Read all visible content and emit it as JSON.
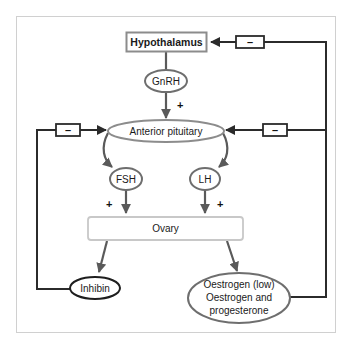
{
  "diagram": {
    "title": "",
    "nodes": {
      "hypothalamus": {
        "label": "Hypothalamus",
        "shape": "rect",
        "border_color": "#8c8c8c"
      },
      "gnrh": {
        "label": "GnRH",
        "shape": "ellipse",
        "border_color": "#6e6e6e"
      },
      "anterior_pituitary": {
        "label": "Anterior pituitary",
        "shape": "ellipse",
        "border_color": "#8c8c8c"
      },
      "fsh": {
        "label": "FSH",
        "shape": "ellipse",
        "border_color": "#6e6e6e"
      },
      "lh": {
        "label": "LH",
        "shape": "ellipse",
        "border_color": "#6e6e6e"
      },
      "ovary": {
        "label": "Ovary",
        "shape": "rounded-rect",
        "border_color": "#c8c8c8"
      },
      "inhibin": {
        "label": "Inhibin",
        "shape": "ellipse",
        "border_color": "#1e1e1e"
      },
      "oestrogen": {
        "label_line1": "Oestrogen (low)",
        "label_line2": "Oestrogen and",
        "label_line3": "progesterone",
        "shape": "ellipse",
        "border_color": "#6e6e6e"
      }
    },
    "signs": {
      "gnrh_to_pituitary": "+",
      "fsh_to_ovary": "+",
      "lh_to_ovary": "+",
      "inhibitor_top": "–",
      "inhibitor_middle_right": "–",
      "inhibitor_left": "–"
    },
    "edges": [
      {
        "from": "hypothalamus",
        "to": "gnrh",
        "type": "line"
      },
      {
        "from": "gnrh",
        "to": "anterior_pituitary",
        "type": "stimulate",
        "sign": "+"
      },
      {
        "from": "anterior_pituitary",
        "to": "fsh",
        "type": "curved-arrow"
      },
      {
        "from": "anterior_pituitary",
        "to": "lh",
        "type": "curved-arrow"
      },
      {
        "from": "fsh",
        "to": "ovary",
        "type": "stimulate",
        "sign": "+"
      },
      {
        "from": "lh",
        "to": "ovary",
        "type": "stimulate",
        "sign": "+"
      },
      {
        "from": "ovary",
        "to": "inhibin",
        "type": "arrow"
      },
      {
        "from": "ovary",
        "to": "oestrogen",
        "type": "arrow"
      },
      {
        "from": "inhibin",
        "to": "anterior_pituitary",
        "type": "inhibit",
        "sign": "–"
      },
      {
        "from": "oestrogen",
        "to": "anterior_pituitary",
        "type": "inhibit",
        "sign": "–"
      },
      {
        "from": "oestrogen",
        "to": "hypothalamus",
        "type": "inhibit",
        "sign": "–"
      }
    ],
    "colors": {
      "feedback_line": "#2b2b2b",
      "stimulatory_arrow": "#5a5a5a",
      "frame_border": "#d0d0d0",
      "background": "#ffffff"
    }
  }
}
